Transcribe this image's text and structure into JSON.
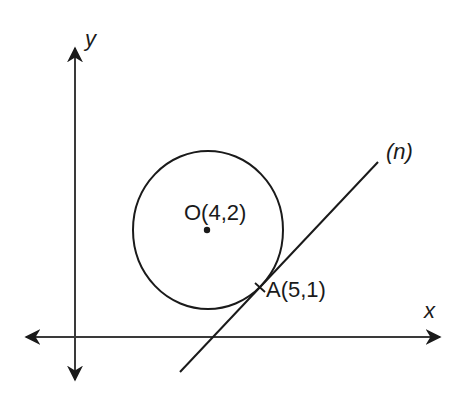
{
  "diagram": {
    "axes": {
      "x_label": "x",
      "y_label": "y"
    },
    "circle": {
      "center_label": "O(4,2)",
      "center": [
        4,
        2
      ]
    },
    "tangent_point": {
      "label": "A(5,1)",
      "coords": [
        5,
        1
      ]
    },
    "tangent_line": {
      "label": "(n)"
    },
    "colors": {
      "stroke": "#1a1a1a",
      "background": "#ffffff"
    }
  }
}
